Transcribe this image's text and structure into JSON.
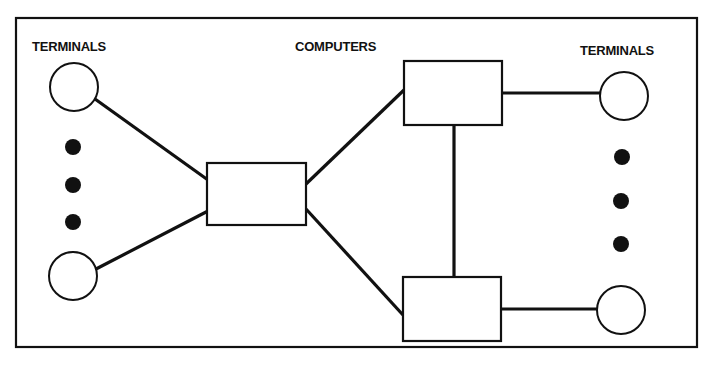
{
  "diagram": {
    "labels": {
      "left_terminals": "TERMINALS",
      "computers": "COMPUTERS",
      "right_terminals": "TERMINALS"
    },
    "nodes": [
      {
        "id": "left-terminal-1",
        "type": "terminal",
        "shape": "circle"
      },
      {
        "id": "left-terminal-n",
        "type": "terminal",
        "shape": "circle"
      },
      {
        "id": "computer-center",
        "type": "computer",
        "shape": "rectangle"
      },
      {
        "id": "computer-top-right",
        "type": "computer",
        "shape": "rectangle"
      },
      {
        "id": "computer-bottom-right",
        "type": "computer",
        "shape": "rectangle"
      },
      {
        "id": "right-terminal-1",
        "type": "terminal",
        "shape": "circle"
      },
      {
        "id": "right-terminal-n",
        "type": "terminal",
        "shape": "circle"
      }
    ],
    "edges": [
      [
        "left-terminal-1",
        "computer-center"
      ],
      [
        "left-terminal-n",
        "computer-center"
      ],
      [
        "computer-center",
        "computer-top-right"
      ],
      [
        "computer-center",
        "computer-bottom-right"
      ],
      [
        "computer-top-right",
        "computer-bottom-right"
      ],
      [
        "computer-top-right",
        "right-terminal-1"
      ],
      [
        "computer-bottom-right",
        "right-terminal-n"
      ]
    ],
    "ellipsis_dots": {
      "left": 3,
      "right": 3
    },
    "colors": {
      "stroke": "#111111",
      "background": "#ffffff"
    }
  }
}
